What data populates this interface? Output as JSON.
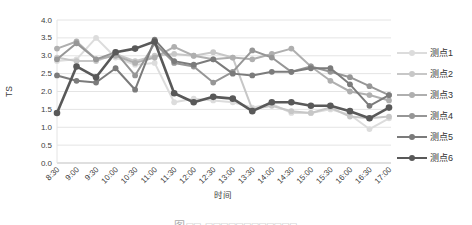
{
  "chart_data": {
    "type": "line",
    "title": "",
    "xlabel": "时间",
    "ylabel": "TS",
    "ylim": [
      0.0,
      4.0
    ],
    "y_tick_step": 0.5,
    "y_ticks": [
      "0.0",
      "0.5",
      "1.0",
      "1.5",
      "2.0",
      "2.5",
      "3.0",
      "3.5",
      "4.0"
    ],
    "grid": "horizontal",
    "legend_position": "right",
    "categories": [
      "8:30",
      "9:00",
      "9:30",
      "10:00",
      "10:30",
      "11:00",
      "11:30",
      "12:00",
      "12:30",
      "13:00",
      "13:30",
      "14:00",
      "14:30",
      "15:00",
      "15:30",
      "16:00",
      "16:30",
      "17:00"
    ],
    "series": [
      {
        "name": "测点1",
        "color": "#dcdcdc",
        "values": [
          2.85,
          2.9,
          3.5,
          2.95,
          2.75,
          2.8,
          1.7,
          1.8,
          1.75,
          1.7,
          1.55,
          1.65,
          1.4,
          1.4,
          1.5,
          1.35,
          0.95,
          1.25
        ]
      },
      {
        "name": "测点2",
        "color": "#c7c7c7",
        "values": [
          2.95,
          2.85,
          2.85,
          3.05,
          2.85,
          3.0,
          3.05,
          3.0,
          3.1,
          2.95,
          1.5,
          1.6,
          1.45,
          1.4,
          1.55,
          1.3,
          1.25,
          1.3
        ]
      },
      {
        "name": "测点3",
        "color": "#afafaf",
        "values": [
          3.2,
          3.4,
          2.9,
          3.0,
          2.8,
          2.95,
          3.25,
          3.0,
          2.9,
          2.95,
          2.9,
          3.05,
          3.2,
          2.7,
          2.3,
          2.0,
          1.9,
          1.75
        ]
      },
      {
        "name": "测点4",
        "color": "#969696",
        "values": [
          2.9,
          3.35,
          2.9,
          3.1,
          2.45,
          3.35,
          2.8,
          2.7,
          2.25,
          2.55,
          3.15,
          2.95,
          2.55,
          2.7,
          2.55,
          2.4,
          2.15,
          1.9
        ]
      },
      {
        "name": "测点5",
        "color": "#7b7b7b",
        "values": [
          2.45,
          2.3,
          2.25,
          2.65,
          2.05,
          3.45,
          2.85,
          2.75,
          2.9,
          2.5,
          2.45,
          2.55,
          2.55,
          2.65,
          2.65,
          2.2,
          1.6,
          1.9
        ]
      },
      {
        "name": "测点6",
        "color": "#595959",
        "values": [
          1.4,
          2.7,
          2.4,
          3.1,
          3.2,
          3.4,
          1.95,
          1.7,
          1.85,
          1.8,
          1.45,
          1.7,
          1.7,
          1.6,
          1.6,
          1.45,
          1.25,
          1.55
        ]
      }
    ]
  },
  "caption": {
    "text": "图□□ □□□□□□□□□□□□"
  },
  "colors": {
    "gridline": "#e4e4e4",
    "axis": "#bfbfbf",
    "tick_text": "#404040"
  }
}
